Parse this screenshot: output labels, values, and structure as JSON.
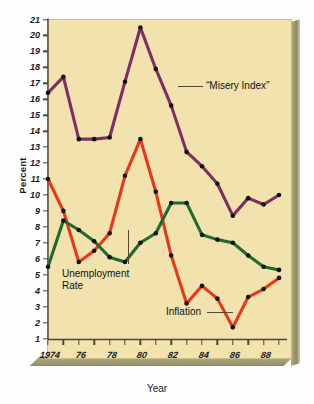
{
  "chart_data": {
    "type": "line",
    "title": "",
    "xlabel": "Year",
    "ylabel": "Percent",
    "x": [
      1974,
      1975,
      1976,
      1977,
      1978,
      1979,
      1980,
      1981,
      1982,
      1983,
      1984,
      1985,
      1986,
      1987,
      1988,
      1989
    ],
    "xtick_labels": [
      "1974",
      "76",
      "78",
      "80",
      "82",
      "84",
      "86",
      "88"
    ],
    "xtick_values": [
      1974,
      1976,
      1978,
      1980,
      1982,
      1984,
      1986,
      1988
    ],
    "ytick_labels": [
      "21",
      "20",
      "19",
      "18",
      "17",
      "16",
      "15",
      "14",
      "13",
      "12",
      "11",
      "10",
      "9",
      "8",
      "7",
      "6",
      "5",
      "4",
      "3",
      "2",
      "1"
    ],
    "ylim": [
      0,
      21.6
    ],
    "xlim": [
      1973.5,
      1989.5
    ],
    "grid": false,
    "legend": "inline-annotations",
    "series": [
      {
        "name": "“Misery Index”",
        "color": "#7d2f63",
        "values": [
          16.4,
          17.4,
          13.5,
          13.5,
          13.6,
          17.1,
          20.5,
          17.9,
          15.6,
          12.7,
          11.8,
          10.7,
          8.7,
          9.8,
          9.4,
          10.0
        ]
      },
      {
        "name": "Inflation",
        "color": "#e8381a",
        "values": [
          11.0,
          9.0,
          5.8,
          6.5,
          7.6,
          11.2,
          13.5,
          10.2,
          6.2,
          3.2,
          4.3,
          3.5,
          1.7,
          3.6,
          4.1,
          4.8
        ]
      },
      {
        "name": "Unemployment Rate",
        "color": "#1d6b2f",
        "values": [
          5.5,
          8.4,
          7.8,
          7.1,
          6.1,
          5.8,
          7.0,
          7.6,
          9.5,
          9.5,
          7.5,
          7.2,
          7.0,
          6.2,
          5.5,
          5.3
        ]
      }
    ],
    "annotations": [
      {
        "name": "misery-index-label",
        "text": "“Misery Index”"
      },
      {
        "name": "unemployment-rate-label",
        "text": "Unemployment\nRate"
      },
      {
        "name": "unemployment-rate-label-line1",
        "text": "Unemployment"
      },
      {
        "name": "unemployment-rate-label-line2",
        "text": "Rate"
      },
      {
        "name": "inflation-label",
        "text": "Inflation"
      }
    ],
    "colors": {
      "plot_background": "#f2e2ae",
      "misery_index": "#7d2f63",
      "inflation": "#e8381a",
      "unemployment": "#1d6b2f",
      "marker": "#14100c",
      "bevel": "#9b9568"
    }
  }
}
